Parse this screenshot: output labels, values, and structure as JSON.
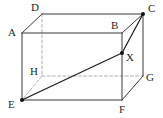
{
  "figure": {
    "kind": "geometry-diagram",
    "shape": "cuboid",
    "canvas": {
      "width": 163,
      "height": 118
    },
    "colors": {
      "background": "#ffffff",
      "visible_edge": "#3b3b3b",
      "hidden_edge": "#b0b0b0",
      "highlight_line": "#1a1a1a",
      "label_text": "#262626",
      "point_marker": "#111111"
    },
    "vertices": [
      {
        "id": "A",
        "label": "A",
        "x": 22,
        "y": 33,
        "label_x": 8,
        "label_y": 27,
        "marker": false,
        "hidden": false
      },
      {
        "id": "B",
        "label": "B",
        "x": 122,
        "y": 33,
        "label_x": 111,
        "label_y": 20,
        "marker": false,
        "hidden": false
      },
      {
        "id": "C",
        "label": "C",
        "x": 143,
        "y": 14,
        "label_x": 148,
        "label_y": 3,
        "marker": true,
        "hidden": false
      },
      {
        "id": "D",
        "label": "D",
        "x": 42,
        "y": 14,
        "label_x": 31,
        "label_y": 2,
        "marker": false,
        "hidden": false
      },
      {
        "id": "E",
        "label": "E",
        "x": 22,
        "y": 100,
        "label_x": 8,
        "label_y": 99,
        "marker": true,
        "hidden": false
      },
      {
        "id": "F",
        "label": "F",
        "x": 122,
        "y": 100,
        "label_x": 119,
        "label_y": 104,
        "marker": false,
        "hidden": false
      },
      {
        "id": "G",
        "label": "G",
        "x": 143,
        "y": 76,
        "label_x": 146,
        "label_y": 72,
        "marker": false,
        "hidden": false
      },
      {
        "id": "H",
        "label": "H",
        "x": 42,
        "y": 76,
        "label_x": 30,
        "label_y": 66,
        "marker": false,
        "hidden": true
      },
      {
        "id": "X",
        "label": "X",
        "x": 122,
        "y": 53,
        "label_x": 126,
        "label_y": 52,
        "marker": true,
        "hidden": false
      }
    ],
    "edges": [
      {
        "from": "A",
        "to": "D",
        "style": "solid",
        "name": "edge-a-d"
      },
      {
        "from": "D",
        "to": "C",
        "style": "solid",
        "name": "edge-d-c"
      },
      {
        "from": "A",
        "to": "B",
        "style": "solid",
        "name": "edge-a-b"
      },
      {
        "from": "B",
        "to": "C",
        "style": "solid",
        "name": "edge-b-c"
      },
      {
        "from": "A",
        "to": "E",
        "style": "solid",
        "name": "edge-a-e"
      },
      {
        "from": "B",
        "to": "F",
        "style": "solid",
        "name": "edge-b-f"
      },
      {
        "from": "C",
        "to": "G",
        "style": "solid",
        "name": "edge-c-g"
      },
      {
        "from": "E",
        "to": "F",
        "style": "solid",
        "name": "edge-e-f"
      },
      {
        "from": "F",
        "to": "G",
        "style": "solid",
        "name": "edge-f-g"
      },
      {
        "from": "D",
        "to": "H",
        "style": "dashed",
        "name": "edge-d-h"
      },
      {
        "from": "H",
        "to": "E",
        "style": "dashed",
        "name": "edge-h-e"
      },
      {
        "from": "H",
        "to": "G",
        "style": "dashed",
        "name": "edge-h-g"
      }
    ],
    "construction_lines": [
      {
        "from": "E",
        "to": "X",
        "style": "solid",
        "name": "line-e-x"
      },
      {
        "from": "X",
        "to": "C",
        "style": "solid",
        "name": "line-x-c"
      }
    ]
  }
}
